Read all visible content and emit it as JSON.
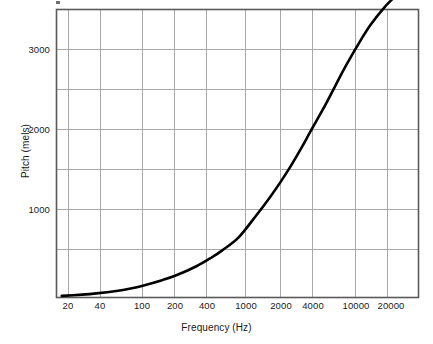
{
  "chart_data": {
    "type": "line",
    "title": "",
    "subtitle": "",
    "xlabel": "Frequency (Hz)",
    "ylabel": "Pitch (mels)",
    "xscale": "log",
    "yscale": "linear",
    "xlim": [
      18,
      26000
    ],
    "ylim": [
      0,
      3500
    ],
    "grid": true,
    "legend": null,
    "legend_position": "none",
    "xticks": [
      20,
      40,
      100,
      200,
      400,
      1000,
      2000,
      4000,
      10000,
      20000
    ],
    "xtick_labels": [
      "20",
      "40",
      "100",
      "200",
      "400",
      "1000",
      "2000",
      "4000",
      "10000",
      "20000"
    ],
    "yticks": [
      1000,
      2000,
      3000
    ],
    "ytick_labels": [
      "1000",
      "2000",
      "3000"
    ],
    "ygridlines": [
      0,
      500,
      1000,
      1500,
      2000,
      2500,
      3000,
      3500
    ],
    "series": [
      {
        "name": "Mel scale",
        "color": "#000000",
        "line_width": 2.6,
        "x": [
          20,
          30,
          40,
          60,
          80,
          100,
          150,
          200,
          300,
          400,
          500,
          700,
          1000,
          1300,
          1600,
          2000,
          2500,
          3000,
          4000,
          5000,
          6000,
          8000,
          10000,
          13000,
          16000,
          20000,
          26000
        ],
        "y": [
          21,
          34,
          47,
          72,
          95,
          118,
          171,
          222,
          313,
          396,
          470,
          600,
          766,
          905,
          1023,
          1158,
          1296,
          1408,
          1583,
          1717,
          1825,
          1993,
          2120,
          2268,
          2381,
          2507,
          2652
        ],
        "y_scaled_note": "Plotted pitch values in mels as read off the figure",
        "plotted_y": [
          20,
          35,
          50,
          80,
          110,
          140,
          210,
          270,
          380,
          480,
          570,
          730,
          1000,
          1210,
          1390,
          1600,
          1830,
          2030,
          2340,
          2600,
          2810,
          3110,
          3320,
          3520,
          3650,
          3780,
          3900
        ]
      }
    ],
    "annotations": []
  },
  "axes": {
    "x_title": "Frequency (Hz)",
    "y_title": "Pitch (mels)"
  },
  "colors": {
    "curve": "#000000",
    "grid": "#a8a8a8",
    "frame": "#5a5a5a",
    "background": "#ffffff",
    "text": "#1a1a1a"
  }
}
